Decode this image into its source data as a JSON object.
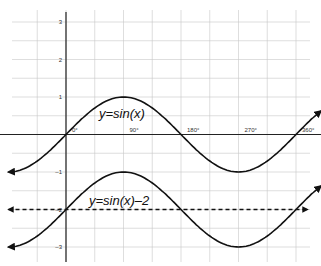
{
  "chart_data": {
    "type": "line",
    "title": "",
    "xlabel": "",
    "ylabel": "",
    "x_unit": "degrees",
    "xlim": [
      -90,
      380
    ],
    "ylim": [
      -3.3,
      3.3
    ],
    "grid": true,
    "x_tick_labels": [
      "0°",
      "90°",
      "180°",
      "270°",
      "360°"
    ],
    "x_ticks": [
      0,
      90,
      180,
      270,
      360
    ],
    "y_tick_labels": [
      "3",
      "2",
      "1",
      "–1",
      "–2",
      "–3"
    ],
    "y_ticks": [
      3,
      2,
      1,
      -1,
      -2,
      -3
    ],
    "series": [
      {
        "name": "y=sin(x)",
        "label": "y=sin(x)",
        "style": "solid",
        "function": "sin(x)",
        "x": [
          -90,
          0,
          90,
          180,
          270,
          360,
          400
        ],
        "values": [
          -1,
          0,
          1,
          0,
          -1,
          0,
          0.64
        ]
      },
      {
        "name": "y=sin(x)−2",
        "label": "y=sin(x)–2",
        "style": "solid",
        "function": "sin(x)-2",
        "x": [
          -90,
          0,
          90,
          180,
          270,
          360,
          400
        ],
        "values": [
          -3,
          -2,
          -1,
          -2,
          -3,
          -2,
          -1.36
        ]
      },
      {
        "name": "midline y=-2",
        "label": "",
        "style": "dashed",
        "function": "-2",
        "x": [
          -90,
          380
        ],
        "values": [
          -2,
          -2
        ]
      }
    ],
    "annotations": [
      {
        "text": "y=sin(x)",
        "x": 100,
        "y": 0.5
      },
      {
        "text": "y=sin(x)–2",
        "x": 100,
        "y": -1.6
      }
    ]
  }
}
